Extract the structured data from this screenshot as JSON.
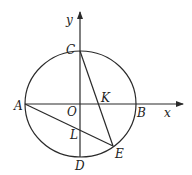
{
  "diagram": {
    "type": "geometry",
    "axes": {
      "x_label": "x",
      "y_label": "y"
    },
    "points": {
      "A": "A",
      "B": "B",
      "C": "C",
      "D": "D",
      "E": "E",
      "O": "O",
      "K": "K",
      "L": "L"
    },
    "segments": [
      "CE",
      "AE",
      "AB",
      "CD"
    ],
    "colors": {
      "stroke": "#2a2a2a",
      "background": "#ffffff"
    }
  }
}
